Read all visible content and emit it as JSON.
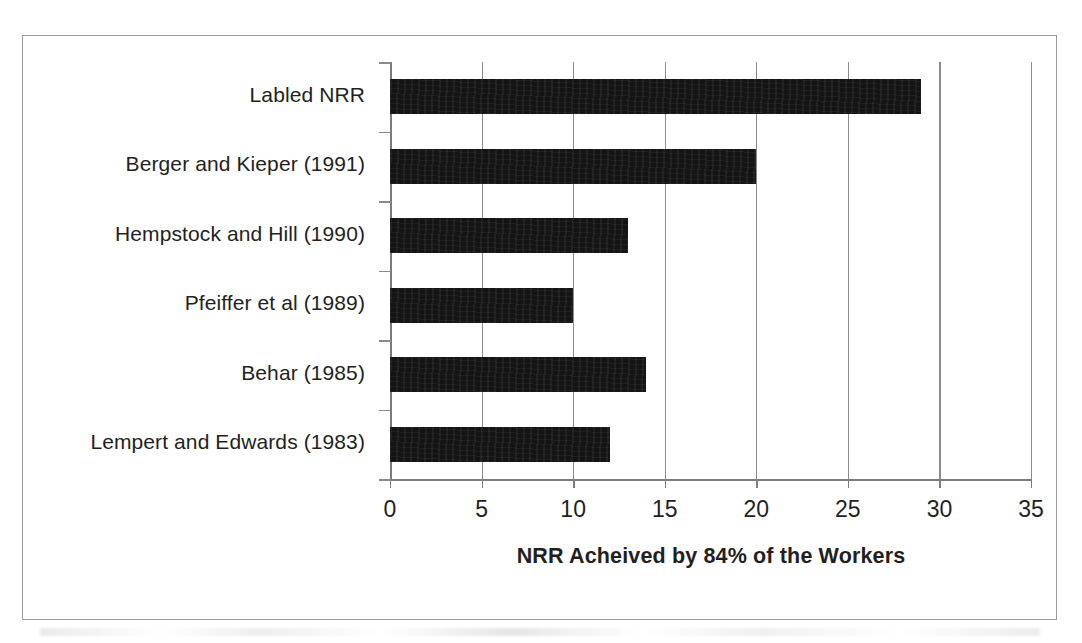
{
  "chart_data": {
    "type": "bar",
    "orientation": "horizontal",
    "title": "",
    "xlabel": "NRR Acheived by 84% of the Workers",
    "ylabel": "",
    "xlim": [
      0,
      35
    ],
    "xticks": [
      0,
      5,
      10,
      15,
      20,
      25,
      30,
      35
    ],
    "xtick_labels": [
      "0",
      "5",
      "10",
      "15",
      "20",
      "25",
      "30",
      "35"
    ],
    "grid": "vertical",
    "legend": "none",
    "bar_color": "#141414",
    "categories": [
      "Labled NRR",
      "Berger and Kieper (1991)",
      "Hempstock and Hill (1990)",
      "Pfeiffer et al (1989)",
      "Behar (1985)",
      "Lempert and Edwards (1983)"
    ],
    "values": [
      29,
      20,
      13,
      10,
      14,
      12
    ],
    "series": [
      {
        "name": "NRR Acheived by 84% of the Workers",
        "values": [
          29,
          20,
          13,
          10,
          14,
          12
        ]
      }
    ]
  },
  "figure": {
    "border_color": "#9a9a9a",
    "background": "#ffffff"
  }
}
